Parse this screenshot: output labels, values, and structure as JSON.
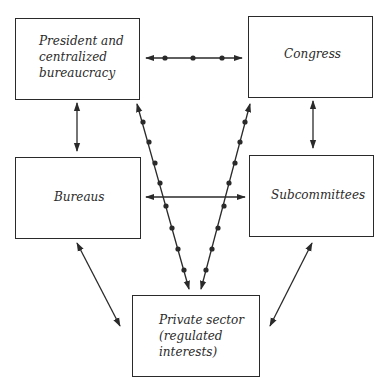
{
  "diagram": {
    "nodes": {
      "president": {
        "label": "President and\ncentralized\nbureaucracy"
      },
      "congress": {
        "label": "Congress"
      },
      "bureaus": {
        "label": "Bureaus"
      },
      "subcommittees": {
        "label": "Subcommittees"
      },
      "private_sector": {
        "label": "Private sector\n(regulated\ninterests)"
      }
    },
    "edges": [
      {
        "from": "president",
        "to": "congress",
        "style": "dotted-bidirectional"
      },
      {
        "from": "president",
        "to": "bureaus",
        "style": "bidirectional"
      },
      {
        "from": "congress",
        "to": "subcommittees",
        "style": "bidirectional"
      },
      {
        "from": "bureaus",
        "to": "subcommittees",
        "style": "bidirectional"
      },
      {
        "from": "bureaus",
        "to": "private_sector",
        "style": "bidirectional"
      },
      {
        "from": "subcommittees",
        "to": "private_sector",
        "style": "bidirectional"
      },
      {
        "from": "president",
        "to": "private_sector",
        "style": "dotted-bidirectional"
      },
      {
        "from": "congress",
        "to": "private_sector",
        "style": "dotted-bidirectional"
      }
    ],
    "colors": {
      "line": "#2a2a2a",
      "background": "#ffffff"
    }
  }
}
